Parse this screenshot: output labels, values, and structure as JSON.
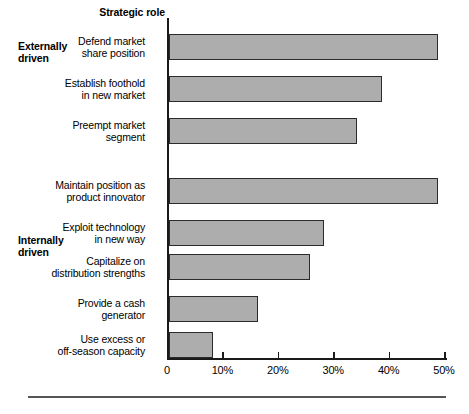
{
  "header": {
    "axis_title": "Strategic role"
  },
  "groups": [
    {
      "id": "externally-driven",
      "label": "Externally\ndriven"
    },
    {
      "id": "internally-driven",
      "label": "Internally\ndriven"
    }
  ],
  "footer": {
    "note": ""
  },
  "chart_data": {
    "type": "bar",
    "orientation": "horizontal",
    "title": "Strategic role",
    "xlabel": "",
    "ylabel": "",
    "xlim": [
      0,
      50
    ],
    "grid": false,
    "legend": null,
    "bar_color": "#adadad",
    "bar_edge_color": "#2b2b2b",
    "axis_color": "#1a1a1a",
    "tick_values": [
      0,
      10,
      20,
      30,
      40,
      50
    ],
    "tick_labels": [
      "0",
      "10%",
      "20%",
      "30%",
      "40%",
      "50%"
    ],
    "categories": [
      "Defend market\nshare position",
      "Establish foothold\nin new market",
      "Preempt market\nsegment",
      "Maintain position as\nproduct innovator",
      "Exploit technology\nin new way",
      "Capitalize on\ndistribution strengths",
      "Provide a cash\ngenerator",
      "Use excess or\noff-season capacity"
    ],
    "values": [
      48.5,
      38.5,
      34,
      48.5,
      28,
      25.5,
      16,
      8
    ],
    "group_of_category": [
      "externally-driven",
      "externally-driven",
      "externally-driven",
      "internally-driven",
      "internally-driven",
      "internally-driven",
      "internally-driven",
      "internally-driven"
    ],
    "bar_tops": [
      16,
      58,
      100,
      160,
      202,
      236,
      278,
      314
    ],
    "bar_height": 26
  }
}
